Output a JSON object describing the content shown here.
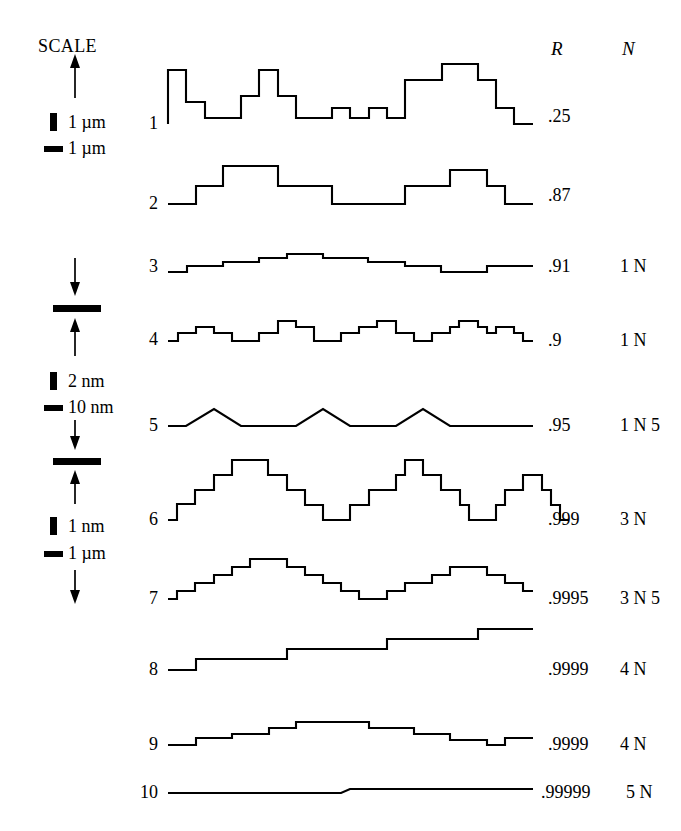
{
  "figure": {
    "scale_title": "SCALE",
    "column_headers": {
      "r": "R",
      "n": "N"
    },
    "legend_blocks": [
      {
        "id": "block-1",
        "vertical_unit": "1 µm",
        "horizontal_unit": "1 µm"
      },
      {
        "id": "block-2",
        "vertical_unit": "2  nm",
        "horizontal_unit": "10 nm"
      },
      {
        "id": "block-3",
        "vertical_unit": "1  nm",
        "horizontal_unit": "1  µm"
      }
    ],
    "traces": [
      {
        "number": "1",
        "r": ".25",
        "n": ""
      },
      {
        "number": "2",
        "r": ".87",
        "n": ""
      },
      {
        "number": "3",
        "r": ".91",
        "n": "1 N"
      },
      {
        "number": "4",
        "r": ".9",
        "n": "1 N"
      },
      {
        "number": "5",
        "r": ".95",
        "n": "1 N 5"
      },
      {
        "number": "6",
        "r": ".999",
        "n": "3 N"
      },
      {
        "number": "7",
        "r": ".9995",
        "n": "3 N 5"
      },
      {
        "number": "8",
        "r": ".9999",
        "n": "4 N"
      },
      {
        "number": "9",
        "r": ".9999",
        "n": "4 N"
      },
      {
        "number": "10",
        "r": ".99999",
        "n": "5 N"
      }
    ],
    "colors": {
      "ink": "#000000",
      "background": "#ffffff"
    }
  },
  "chart_data": {
    "type": "line",
    "title": "",
    "xlabel": "",
    "ylabel": "",
    "series": [
      {
        "name": "1",
        "R": 0.25,
        "N": "",
        "baseline_y": 124,
        "points": "168,124 168,70 186,70 186,102 205,102 205,118 241,118 241,96 259,96 259,70 278,70 278,96 296,96 296,118 332,118 332,108 350,108 350,118 369,118 369,108 387,108 387,118 405,118 405,80 442,80 442,64 478,64 478,80 496,80 496,108 514,108 514,124 533,124"
      },
      {
        "name": "2",
        "R": 0.87,
        "N": "",
        "baseline_y": 204,
        "points": "168,204 196,204 196,186 223,186 223,166 278,166 278,186 332,186 332,204 405,204 405,186 450,186 450,170 487,170 487,186 505,186 505,204 533,204"
      },
      {
        "name": "3",
        "R": 0.91,
        "N": "1 N",
        "baseline_y": 272,
        "points": "168,272 187,272 187,266 223,266 223,262 259,262 259,258 287,258 287,254 323,254 323,258 368,258 368,262 405,262 405,266 441,266 441,272 487,272 487,266 533,266"
      },
      {
        "name": "4",
        "R": 0.9,
        "N": "1 N",
        "baseline_y": 341,
        "points": "168,341 178,341 178,333 196,333 196,327 214,327 214,333 232,333 232,341 259,341 259,333 278,333 278,321 296,321 296,327 314,327 314,341 341,341 341,333 359,333 359,327 377,327 377,321 396,321 396,333 414,333 414,341 432,341 432,333 450,333 450,327 459,327 459,321 478,321 478,327 487,327 487,333 496,333 496,327 514,327 514,333 523,333 523,341 533,341"
      },
      {
        "name": "5",
        "R": 0.95,
        "N": "1 N 5",
        "baseline_y": 426,
        "points": "168,426 186,426 214,409 241,426 296,426 323,409 350,426 396,426 423,409 450,426 533,426"
      },
      {
        "name": "6",
        "R": 0.999,
        "N": "3 N",
        "baseline_y": 520,
        "points": "168,520 177,520 177,504 195,504 195,490 214,490 214,475 232,475 232,460 268,460 268,475 287,475 287,490 305,490 305,505 323,505 323,520 350,520 350,505 369,505 369,490 396,490 396,475 405,475 405,460 423,460 423,475 441,475 441,490 460,490 460,505 469,505 469,520 496,520 496,505 505,505 505,490 523,490 523,475 542,475 542,490 551,490 551,505 560,505 560,520 569,520"
      },
      {
        "name": "7",
        "R": 0.9995,
        "N": "3 N 5",
        "baseline_y": 599,
        "points": "168,599 177,599 177,591 195,591 195,583 214,583 214,575 232,575 232,567 250,567 250,559 287,559 287,567 305,567 305,575 323,575 323,583 341,583 341,591 359,591 359,599 387,599 387,591 405,591 405,583 432,583 432,575 450,575 450,567 487,567 487,575 505,575 505,583 523,583 523,591 533,591"
      },
      {
        "name": "8",
        "R": 0.9999,
        "N": "4 N",
        "baseline_y": 670,
        "points": "168,670 196,670 196,659 287,659 287,649 387,649 387,639 478,639 478,629 533,629"
      },
      {
        "name": "9",
        "R": 0.9999,
        "N": "4 N",
        "baseline_y": 745,
        "points": "168,745 196,745 196,738 232,738 232,734 269,734 269,728 296,728 296,722 369,722 369,728 414,728 414,734 450,734 450,740 487,740 487,745 505,745 505,738 533,738"
      },
      {
        "name": "10",
        "R": 0.99999,
        "N": "5 N",
        "baseline_y": 793,
        "points": "168,793 341,793 350,789 533,789"
      }
    ]
  }
}
